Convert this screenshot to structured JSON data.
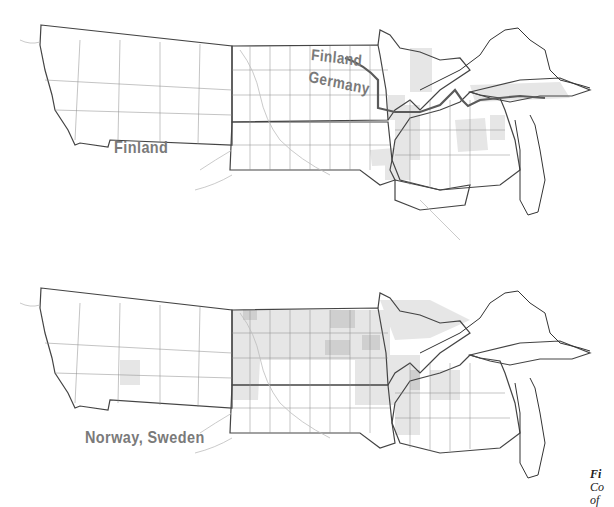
{
  "maps": [
    {
      "id": "top",
      "region": "Upper Midwest and Northern Plains counties",
      "labels": [
        {
          "text": "Finland",
          "role": "ancestry-label-west"
        },
        {
          "text": "Finland",
          "role": "ancestry-label-boundary-upper"
        },
        {
          "text": "Germany",
          "role": "ancestry-label-boundary-lower"
        }
      ],
      "boundary_line": {
        "description": "dark line dividing Finland (north) and Germany (south) across MN, WI, Upper Michigan"
      },
      "colors": {
        "shade_light": "#e8e8e8",
        "shade_medium": "#d4d4d4",
        "county_line": "#555555",
        "river": "#bdbdbd",
        "boundary": "#5a5a5a",
        "label": "#7a7a7a"
      }
    },
    {
      "id": "bottom",
      "region": "Upper Midwest and Northern Plains counties",
      "labels": [
        {
          "text": "Norway, Sweden",
          "role": "ancestry-label"
        }
      ],
      "colors": {
        "shade_light": "#ebebeb",
        "shade_medium": "#d6d6d6",
        "shade_dark": "#c2c2c2",
        "county_line": "#555555",
        "river": "#bdbdbd",
        "label": "#7a7a7a"
      }
    }
  ],
  "caption": {
    "line1": "Fi",
    "line2": "Co",
    "line3": "of"
  }
}
